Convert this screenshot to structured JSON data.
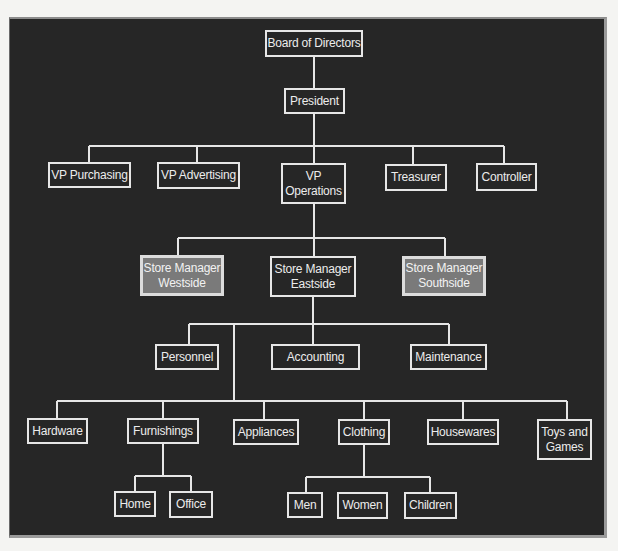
{
  "chart": {
    "colors": {
      "background": "#262626",
      "line": "#e6e6e6",
      "highlight_fill": "#7a7a7a",
      "page": "#f4f4f2"
    },
    "nodes": {
      "board": "Board of Directors",
      "president": "President",
      "vp_purchasing": "VP Purchasing",
      "vp_advertising": "VP Advertising",
      "vp_operations": "VP\nOperations",
      "treasurer": "Treasurer",
      "controller": "Controller",
      "sm_westside": "Store Manager\nWestside",
      "sm_eastside": "Store Manager\nEastside",
      "sm_southside": "Store Manager\nSouthside",
      "personnel": "Personnel",
      "accounting": "Accounting",
      "maintenance": "Maintenance",
      "hardware": "Hardware",
      "furnishings": "Furnishings",
      "appliances": "Appliances",
      "clothing": "Clothing",
      "housewares": "Housewares",
      "toys_games": "Toys and\nGames",
      "home": "Home",
      "office": "Office",
      "men": "Men",
      "women": "Women",
      "children": "Children"
    },
    "highlighted": [
      "sm_westside",
      "sm_southside"
    ],
    "hierarchy": {
      "board": [
        "president"
      ],
      "president": [
        "vp_purchasing",
        "vp_advertising",
        "vp_operations",
        "treasurer",
        "controller"
      ],
      "vp_operations": [
        "sm_westside",
        "sm_eastside",
        "sm_southside"
      ],
      "sm_eastside": [
        "personnel",
        "accounting",
        "maintenance",
        "hardware",
        "furnishings",
        "appliances",
        "clothing",
        "housewares",
        "toys_games"
      ],
      "furnishings": [
        "home",
        "office"
      ],
      "clothing": [
        "men",
        "women",
        "children"
      ]
    }
  }
}
